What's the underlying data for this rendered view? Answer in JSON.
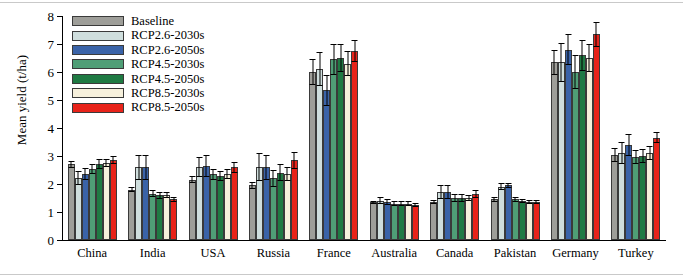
{
  "chart_data": {
    "type": "bar",
    "title": "",
    "xlabel": "",
    "ylabel": "Mean yield (t/ha)",
    "ylim": [
      0,
      8
    ],
    "yticks": [
      0,
      1,
      2,
      3,
      4,
      5,
      6,
      7,
      8
    ],
    "ytick_labels": [
      "0",
      "1",
      "2",
      "3",
      "4",
      "5",
      "6",
      "7",
      "8"
    ],
    "grid": false,
    "legend_position": "top-left",
    "categories": [
      "China",
      "India",
      "USA",
      "Russia",
      "France",
      "Australia",
      "Canada",
      "Pakistan",
      "Germany",
      "Turkey"
    ],
    "series": [
      {
        "name": "Baseline",
        "color": "#9e9e99",
        "values": [
          2.7,
          1.8,
          2.15,
          1.95,
          6.0,
          1.35,
          1.35,
          1.45,
          6.35,
          3.05
        ],
        "errors": [
          0.12,
          0.1,
          0.12,
          0.12,
          0.45,
          0.06,
          0.08,
          0.08,
          0.45,
          0.25
        ]
      },
      {
        "name": "RCP2.6-2030s",
        "color": "#cfdedd",
        "values": [
          2.2,
          2.6,
          2.6,
          2.6,
          6.1,
          1.4,
          1.7,
          1.9,
          6.35,
          3.1
        ],
        "errors": [
          0.25,
          0.45,
          0.35,
          0.5,
          0.6,
          0.12,
          0.25,
          0.12,
          0.7,
          0.4
        ]
      },
      {
        "name": "RCP2.6-2050s",
        "color": "#3a63a8",
        "values": [
          2.35,
          2.6,
          2.65,
          2.6,
          5.35,
          1.35,
          1.7,
          1.95,
          6.8,
          3.4
        ],
        "errors": [
          0.22,
          0.45,
          0.4,
          0.45,
          0.55,
          0.1,
          0.25,
          0.1,
          0.55,
          0.4
        ]
      },
      {
        "name": "RCP4.5-2030s",
        "color": "#4f9e76",
        "values": [
          2.55,
          1.65,
          2.35,
          2.2,
          6.45,
          1.3,
          1.5,
          1.45,
          6.0,
          2.95
        ],
        "errors": [
          0.18,
          0.12,
          0.2,
          0.3,
          0.55,
          0.08,
          0.15,
          0.1,
          0.6,
          0.25
        ]
      },
      {
        "name": "RCP4.5-2050s",
        "color": "#1f7a43",
        "values": [
          2.7,
          1.6,
          2.3,
          2.4,
          6.5,
          1.3,
          1.5,
          1.4,
          6.6,
          3.0
        ],
        "errors": [
          0.18,
          0.12,
          0.18,
          0.3,
          0.5,
          0.08,
          0.15,
          0.08,
          0.55,
          0.25
        ]
      },
      {
        "name": "RCP8.5-2030s",
        "color": "#f6f0dc",
        "values": [
          2.75,
          1.6,
          2.35,
          2.35,
          6.3,
          1.3,
          1.5,
          1.35,
          6.5,
          3.1
        ],
        "errors": [
          0.15,
          0.1,
          0.18,
          0.25,
          0.45,
          0.08,
          0.12,
          0.08,
          0.5,
          0.25
        ]
      },
      {
        "name": "RCP8.5-2050s",
        "color": "#e8231a",
        "values": [
          2.85,
          1.45,
          2.6,
          2.85,
          6.75,
          1.25,
          1.65,
          1.35,
          7.35,
          3.65
        ],
        "errors": [
          0.15,
          0.1,
          0.2,
          0.3,
          0.4,
          0.08,
          0.15,
          0.08,
          0.45,
          0.2
        ]
      }
    ]
  }
}
